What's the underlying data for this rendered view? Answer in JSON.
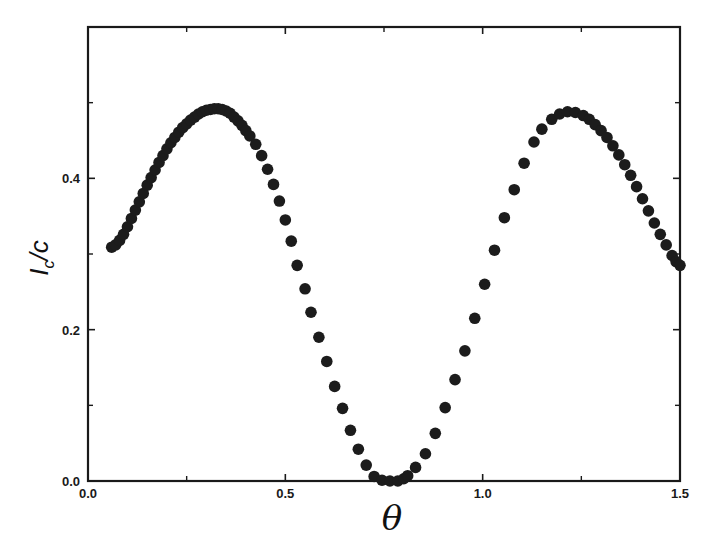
{
  "chart_data": {
    "type": "scatter",
    "title": "",
    "xlabel": "θ",
    "ylabel": "I_c/C",
    "xlim": [
      0.0,
      1.5
    ],
    "ylim": [
      0.0,
      0.6
    ],
    "grid": false,
    "legend": null,
    "x_ticks": [
      {
        "value": 0.0,
        "label": "0.0"
      },
      {
        "value": 0.5,
        "label": "0.5"
      },
      {
        "value": 1.0,
        "label": "1.0"
      },
      {
        "value": 1.5,
        "label": "1.5"
      }
    ],
    "x_minor_ticks": [
      0.25,
      0.75,
      1.25
    ],
    "y_ticks": [
      {
        "value": 0.0,
        "label": "0.0"
      },
      {
        "value": 0.2,
        "label": "0.2"
      },
      {
        "value": 0.4,
        "label": "0.4"
      }
    ],
    "y_minor_ticks": [
      0.1,
      0.3,
      0.5
    ],
    "marker_color": "#1c1c1c",
    "series": [
      {
        "name": "I_c/C vs θ",
        "x": [
          0.06,
          0.07,
          0.08,
          0.09,
          0.1,
          0.11,
          0.12,
          0.13,
          0.14,
          0.15,
          0.16,
          0.17,
          0.18,
          0.19,
          0.2,
          0.21,
          0.22,
          0.23,
          0.24,
          0.25,
          0.26,
          0.27,
          0.28,
          0.29,
          0.3,
          0.31,
          0.32,
          0.33,
          0.34,
          0.35,
          0.36,
          0.37,
          0.38,
          0.39,
          0.4,
          0.41,
          0.425,
          0.44,
          0.455,
          0.47,
          0.485,
          0.5,
          0.515,
          0.53,
          0.55,
          0.565,
          0.585,
          0.605,
          0.625,
          0.645,
          0.665,
          0.685,
          0.705,
          0.725,
          0.745,
          0.765,
          0.785,
          0.8,
          0.81,
          0.83,
          0.855,
          0.88,
          0.905,
          0.93,
          0.955,
          0.98,
          1.005,
          1.03,
          1.055,
          1.08,
          1.105,
          1.13,
          1.15,
          1.175,
          1.195,
          1.215,
          1.235,
          1.255,
          1.27,
          1.285,
          1.3,
          1.315,
          1.33,
          1.345,
          1.36,
          1.375,
          1.39,
          1.405,
          1.42,
          1.435,
          1.45,
          1.465,
          1.48,
          1.49,
          1.5
        ],
        "y": [
          0.309,
          0.312,
          0.318,
          0.326,
          0.336,
          0.347,
          0.358,
          0.369,
          0.38,
          0.391,
          0.401,
          0.411,
          0.421,
          0.43,
          0.439,
          0.447,
          0.454,
          0.461,
          0.467,
          0.472,
          0.477,
          0.481,
          0.485,
          0.488,
          0.49,
          0.491,
          0.492,
          0.492,
          0.491,
          0.489,
          0.486,
          0.481,
          0.476,
          0.47,
          0.463,
          0.456,
          0.445,
          0.43,
          0.412,
          0.392,
          0.37,
          0.345,
          0.317,
          0.285,
          0.254,
          0.223,
          0.19,
          0.158,
          0.125,
          0.096,
          0.067,
          0.042,
          0.021,
          0.006,
          0.001,
          0.0,
          0.0,
          0.003,
          0.007,
          0.018,
          0.036,
          0.063,
          0.097,
          0.134,
          0.172,
          0.215,
          0.26,
          0.305,
          0.348,
          0.385,
          0.42,
          0.448,
          0.465,
          0.478,
          0.485,
          0.488,
          0.487,
          0.483,
          0.478,
          0.471,
          0.463,
          0.454,
          0.443,
          0.431,
          0.418,
          0.404,
          0.389,
          0.373,
          0.357,
          0.341,
          0.326,
          0.312,
          0.298,
          0.29,
          0.285
        ]
      }
    ]
  }
}
